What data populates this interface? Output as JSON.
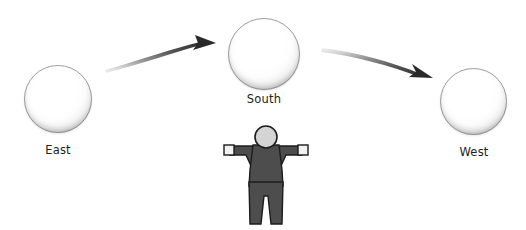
{
  "scene": {
    "width": 526,
    "height": 230,
    "background": "#ffffff",
    "title": "Celestial spheres path diagram with observer"
  },
  "spheres": [
    {
      "id": "east",
      "label": "East",
      "cx": 58,
      "cy": 99,
      "r": 34,
      "fill": "#ffffff",
      "edge": "#8e8e8e"
    },
    {
      "id": "south",
      "label": "South",
      "cx": 264,
      "cy": 54,
      "r": 36,
      "fill": "#ffffff",
      "edge": "#8e8e8e"
    },
    {
      "id": "west",
      "label": "West",
      "cx": 473,
      "cy": 101,
      "r": 33,
      "fill": "#ffffff",
      "edge": "#8e8e8e"
    }
  ],
  "arrows": [
    {
      "id": "east-to-south",
      "from": "east",
      "to": "south",
      "direction": "right-up",
      "color_start": "#e9e9e9",
      "color_end": "#2b2b2b",
      "head": "solid-triangle"
    },
    {
      "id": "south-to-west",
      "from": "south",
      "to": "west",
      "direction": "right-down",
      "color_start": "#e9e9e9",
      "color_end": "#2b2b2b",
      "head": "solid-triangle"
    }
  ],
  "figure": {
    "id": "observer",
    "name": "observer-figure",
    "pose": "arms-outstretched",
    "body_color": "#4d4d4d",
    "outline_color": "#1c1c1c",
    "head_fill": "#d4d4d4",
    "hand_fill": "#f2f2f2"
  }
}
